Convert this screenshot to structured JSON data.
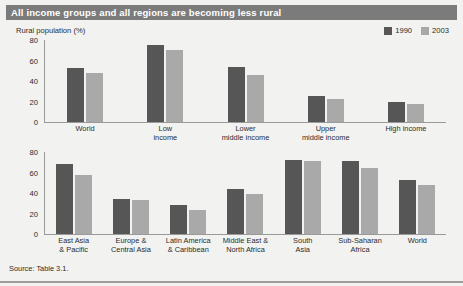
{
  "title": "All income groups and all regions are becoming less rural",
  "axis_caption": "Rural population (%)",
  "source": "Source: Table 3.1.",
  "colors": {
    "banner": "#7b7b7b",
    "series_1990": "#565656",
    "series_2003": "#a9a9a9",
    "background": "#f2f2f0",
    "axis": "#9a9a9a"
  },
  "legend": {
    "items": [
      {
        "label": "1990",
        "color": "#565656",
        "icon": "legend-swatch-dark"
      },
      {
        "label": "2003",
        "color": "#a9a9a9",
        "icon": "legend-swatch-light"
      }
    ]
  },
  "chart_data": [
    {
      "type": "bar",
      "title": "All income groups and all regions are becoming less rural",
      "subtitle": "By income group",
      "xlabel": "",
      "ylabel": "Rural population (%)",
      "ylim": [
        0,
        80
      ],
      "yticks": [
        0,
        20,
        40,
        60,
        80
      ],
      "grid": false,
      "legend_position": "top-right",
      "categories": [
        "World",
        "Low income",
        "Lower middle income",
        "Upper middle income",
        "High income"
      ],
      "category_lines": [
        [
          "World"
        ],
        [
          "Low",
          "income"
        ],
        [
          "Lower",
          "middle income"
        ],
        [
          "Upper",
          "middle income"
        ],
        [
          "High income"
        ]
      ],
      "series": [
        {
          "name": "1990",
          "values": [
            53,
            75,
            54,
            25,
            20
          ]
        },
        {
          "name": "2003",
          "values": [
            48,
            70,
            46,
            22,
            18
          ]
        }
      ]
    },
    {
      "type": "bar",
      "subtitle": "By region",
      "xlabel": "",
      "ylabel": "Rural population (%)",
      "ylim": [
        0,
        80
      ],
      "yticks": [
        0,
        20,
        40,
        60,
        80
      ],
      "grid": false,
      "legend_position": "top-right",
      "categories": [
        "East Asia & Pacific",
        "Europe & Central Asia",
        "Latin America & Caribbean",
        "Middle East & North Africa",
        "South Asia",
        "Sub-Saharan Africa",
        "World"
      ],
      "category_lines": [
        [
          "East Asia",
          "& Pacific"
        ],
        [
          "Europe &",
          "Central Asia"
        ],
        [
          "Latin America",
          "& Caribbean"
        ],
        [
          "Middle East &",
          "North Africa"
        ],
        [
          "South",
          "Asia"
        ],
        [
          "Sub-Saharan",
          "Africa"
        ],
        [
          "World"
        ]
      ],
      "series": [
        {
          "name": "1990",
          "values": [
            68,
            34,
            28,
            44,
            72,
            71,
            53
          ]
        },
        {
          "name": "2003",
          "values": [
            58,
            33,
            23,
            39,
            71,
            64,
            48
          ]
        }
      ]
    }
  ]
}
